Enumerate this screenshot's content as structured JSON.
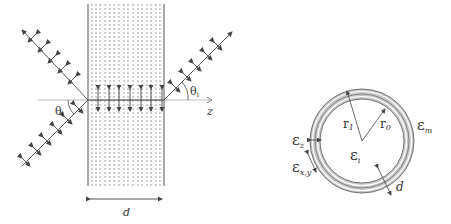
{
  "left_panel": {
    "description": "Plane wave incident at angle theta on a multilayer slab of thickness d, propagating along z",
    "labels": {
      "theta_in": "θ",
      "theta_in_sub": "i",
      "theta_out": "θ",
      "theta_out_sub": "i",
      "axis": "z",
      "thickness": "d"
    },
    "slab": {
      "x_left": 88,
      "x_right": 164,
      "top": 4,
      "bottom": 186
    },
    "axis_y": 100
  },
  "right_panel": {
    "description": "Cross-section of cylindrical multilayer shell",
    "labels": {
      "eps_z": "ε",
      "eps_z_sub": "z",
      "eps_xy": "ε",
      "eps_xy_sub": "x,y",
      "eps_i": "ε",
      "eps_i_sub": "i",
      "eps_m": "ε",
      "eps_m_sub": "m",
      "r1": "r",
      "r1_sub": "1",
      "r0": "r",
      "r0_sub": "0",
      "d": "d"
    },
    "circle": {
      "cx": 362,
      "cy": 141,
      "r_outer": 52,
      "r_inner": 42,
      "shell_fill": "#c8c8c8"
    }
  },
  "colors": {
    "line": "#444444",
    "light": "#999999",
    "axis": "#aaaaaa"
  }
}
